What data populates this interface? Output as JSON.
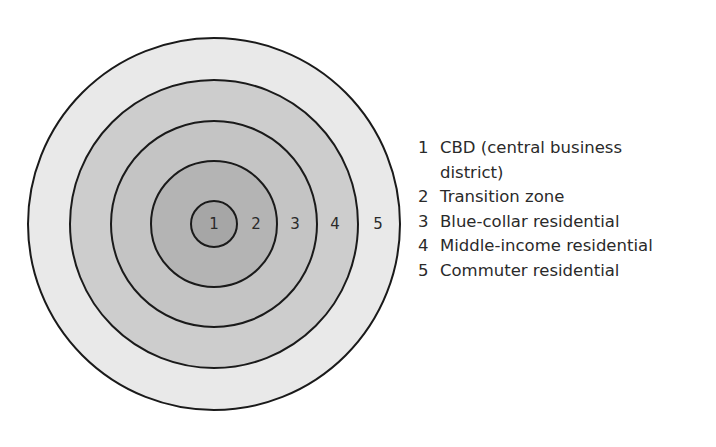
{
  "diagram": {
    "center": {
      "x": 214,
      "y": 224
    },
    "rings": [
      {
        "id": "5",
        "radius": 186,
        "fill": "#e9e9e9"
      },
      {
        "id": "4",
        "radius": 144,
        "fill": "#cdcdcd"
      },
      {
        "id": "3",
        "radius": 103,
        "fill": "#c4c4c4"
      },
      {
        "id": "2",
        "radius": 63,
        "fill": "#b4b4b4"
      },
      {
        "id": "1",
        "radius": 23,
        "fill": "#a6a6a6"
      }
    ],
    "ring_labels": [
      {
        "text": "1",
        "x": 214,
        "y": 229
      },
      {
        "text": "2",
        "x": 256,
        "y": 229
      },
      {
        "text": "3",
        "x": 295,
        "y": 229
      },
      {
        "text": "4",
        "x": 335,
        "y": 229
      },
      {
        "text": "5",
        "x": 378,
        "y": 229
      }
    ],
    "stroke": "#1a1a1a"
  },
  "legend": {
    "items": [
      {
        "num": "1",
        "text": "CBD (central business district)"
      },
      {
        "num": "2",
        "text": "Transition zone"
      },
      {
        "num": "3",
        "text": "Blue-collar residential"
      },
      {
        "num": "4",
        "text": "Middle-income residential"
      },
      {
        "num": "5",
        "text": "Commuter residential"
      }
    ]
  }
}
